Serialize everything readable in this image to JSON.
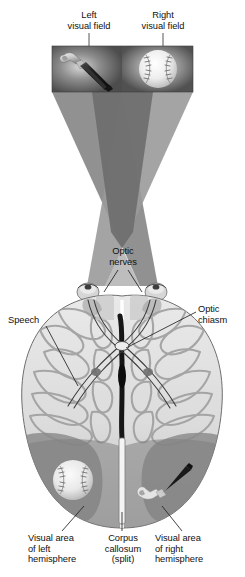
{
  "figure": {
    "background_color": "#ffffff",
    "text_color": "#111111"
  },
  "labels": {
    "left_visual_field": "Left\nvisual field",
    "right_visual_field": "Right\nvisual field",
    "optic_nerves": "Optic\nnerves",
    "speech": "Speech",
    "optic_chiasm": "Optic\nchiasm",
    "visual_area_left": "Visual area\nof left\nhemisphere",
    "corpus_callosum": "Corpus\ncallosum\n(split)",
    "visual_area_right": "Visual area\nof right\nhemisphere"
  },
  "stimulus_panel": {
    "left_object": "hammer",
    "right_object": "baseball",
    "panel_background": "#585858",
    "left_panel_background": "#5a5a5a",
    "right_panel_background": "#606060"
  },
  "cones": {
    "left_field_cone_color": "#7e7e7e",
    "right_field_cone_color": "#8d8d8d",
    "overlap_color": "#6a6a6a",
    "description": "Two visual-field projection cones crossing in an X at the optic chiasm"
  },
  "brain": {
    "view": "superior (top-down) view of cerebral hemispheres",
    "cortex_color": "#dedede",
    "gyri_shadow_color": "#9a9a9a",
    "visual_cortex_shading": "#808080",
    "midline_fissure_color": "#1c1c1c",
    "left_hemisphere_percept": "baseball",
    "right_hemisphere_percept": "hammer"
  },
  "colors": {
    "leader_line": "#222222",
    "outline": "#555555"
  }
}
